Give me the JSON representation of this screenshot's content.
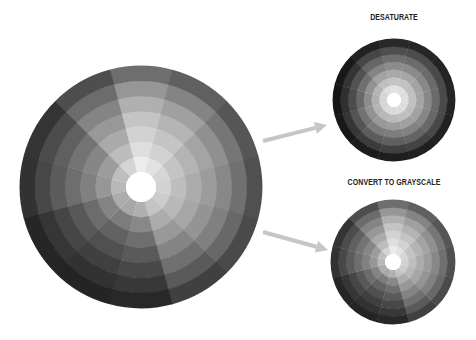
{
  "labels": {
    "desaturate": "DESATURATE",
    "grayscale": "CONVERT TO GRAYSCALE"
  },
  "colors": {
    "background": "#ffffff",
    "arrow": "#c6c6c6",
    "label": "#222222",
    "hole": "#ffffff"
  },
  "wheel_structure": {
    "sectors": 12,
    "sector_width_deg": 30,
    "first_sector_center_deg": 0,
    "rings": 7
  },
  "wheels": [
    {
      "id": "original-grayscale-wheel",
      "cx": 141,
      "cy": 187,
      "r": 121,
      "hole_r": 15,
      "sector_gray": [
        [
          236,
          222,
          210,
          196,
          176,
          150,
          110
        ],
        [
          226,
          210,
          196,
          180,
          160,
          132,
          96
        ],
        [
          214,
          196,
          180,
          164,
          144,
          118,
          86
        ],
        [
          210,
          190,
          172,
          156,
          136,
          112,
          80
        ],
        [
          204,
          184,
          166,
          148,
          128,
          104,
          74
        ],
        [
          196,
          172,
          152,
          132,
          112,
          90,
          64
        ],
        [
          176,
          136,
          110,
          90,
          72,
          56,
          40
        ],
        [
          168,
          124,
          98,
          80,
          64,
          50,
          36
        ],
        [
          172,
          132,
          108,
          88,
          70,
          54,
          38
        ],
        [
          184,
          150,
          128,
          110,
          92,
          72,
          50
        ],
        [
          190,
          156,
          134,
          116,
          96,
          76,
          52
        ],
        [
          212,
          188,
          170,
          152,
          132,
          108,
          78
        ]
      ]
    },
    {
      "id": "desaturate-wheel",
      "cx": 394,
      "cy": 100,
      "r": 61,
      "hole_r": 7,
      "sector_gray": [
        [
          225,
          196,
          168,
          140,
          110,
          78,
          40
        ],
        [
          224,
          194,
          166,
          138,
          108,
          76,
          38
        ],
        [
          222,
          192,
          164,
          136,
          106,
          74,
          36
        ],
        [
          222,
          192,
          164,
          136,
          106,
          74,
          36
        ],
        [
          220,
          190,
          162,
          134,
          104,
          72,
          34
        ],
        [
          220,
          190,
          160,
          130,
          100,
          68,
          32
        ],
        [
          218,
          186,
          156,
          126,
          96,
          64,
          30
        ],
        [
          216,
          184,
          152,
          122,
          92,
          60,
          28
        ],
        [
          214,
          180,
          146,
          114,
          84,
          54,
          24
        ],
        [
          212,
          176,
          140,
          106,
          76,
          48,
          22
        ],
        [
          214,
          180,
          146,
          112,
          82,
          52,
          24
        ],
        [
          222,
          192,
          162,
          132,
          102,
          70,
          34
        ]
      ]
    },
    {
      "id": "grayscale-wheel",
      "cx": 393,
      "cy": 262,
      "r": 62,
      "hole_r": 8,
      "sector_gray": [
        [
          236,
          222,
          210,
          196,
          176,
          150,
          110
        ],
        [
          226,
          210,
          196,
          180,
          160,
          132,
          96
        ],
        [
          214,
          196,
          180,
          164,
          144,
          118,
          86
        ],
        [
          210,
          190,
          172,
          156,
          136,
          112,
          80
        ],
        [
          204,
          184,
          166,
          148,
          128,
          104,
          74
        ],
        [
          196,
          172,
          152,
          132,
          112,
          90,
          64
        ],
        [
          176,
          136,
          110,
          90,
          72,
          56,
          40
        ],
        [
          168,
          124,
          98,
          80,
          64,
          50,
          36
        ],
        [
          172,
          132,
          108,
          88,
          70,
          54,
          38
        ],
        [
          184,
          150,
          128,
          110,
          92,
          72,
          50
        ],
        [
          190,
          156,
          134,
          116,
          96,
          76,
          52
        ],
        [
          212,
          188,
          170,
          152,
          132,
          108,
          78
        ]
      ]
    }
  ],
  "arrows": [
    {
      "id": "arrow-to-desaturate",
      "x1": 263,
      "y1": 141,
      "x2": 327,
      "y2": 125
    },
    {
      "id": "arrow-to-grayscale",
      "x1": 263,
      "y1": 232,
      "x2": 328,
      "y2": 250
    }
  ]
}
